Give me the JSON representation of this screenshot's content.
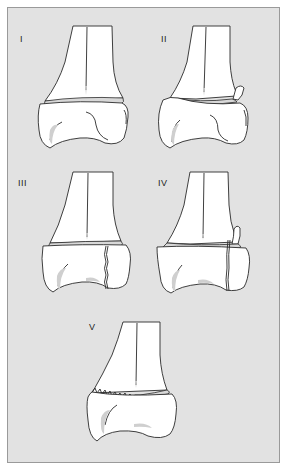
{
  "figure": {
    "type": "Salter-Harris physeal fracture classification (distal tibia)",
    "background_color": "#e2e2e2",
    "border_color": "#9a9a9a",
    "panels": [
      {
        "id": "I",
        "label": "I"
      },
      {
        "id": "II",
        "label": "II"
      },
      {
        "id": "III",
        "label": "III"
      },
      {
        "id": "IV",
        "label": "IV"
      },
      {
        "id": "V",
        "label": "V"
      }
    ]
  }
}
